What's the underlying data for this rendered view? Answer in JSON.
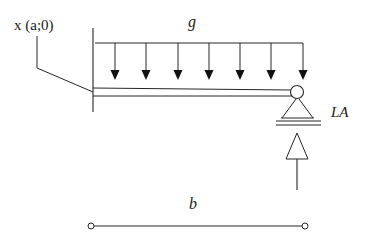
{
  "figure": {
    "title_text": "",
    "stroke_color": "#262626",
    "background": "#ffffff"
  },
  "labels": {
    "point_label": "x (a;0)",
    "load_label": "g",
    "support_label": "LA",
    "span_label": "b"
  },
  "geometry": {
    "wall_line": {
      "x": 93,
      "y_top": 28,
      "y_bottom": 112
    },
    "beam_top_line": {
      "x_start": 93,
      "x_end": 300,
      "y": 88
    },
    "beam_bottom_line": {
      "x_start": 93,
      "x_end": 300,
      "y": 96
    },
    "load_bar": {
      "x_start": 95,
      "x_end": 303,
      "y": 43
    },
    "load_arrow_tips_y": 79,
    "load_arrow_x_positions": [
      115,
      146,
      178,
      209,
      240,
      271,
      303
    ],
    "load_arrow_count": 7,
    "support_pin": {
      "cx": 297,
      "cy": 92,
      "r": 6
    },
    "support_triangle": {
      "apex_x": 297,
      "apex_y": 99,
      "base_left_x": 282,
      "base_right_x": 313,
      "base_y": 118
    },
    "ground_lines": [
      {
        "x_start": 276,
        "x_end": 320,
        "y": 120
      },
      {
        "x_start": 276,
        "x_end": 320,
        "y": 124
      }
    ],
    "reaction_arrow": {
      "x": 297,
      "tail_y": 190,
      "head_tip_y": 133,
      "head_half_width": 11,
      "head_base_y": 158
    },
    "leader_line": {
      "x1": 37,
      "y1": 36,
      "x2": 37,
      "y2": 68,
      "x3": 93,
      "y3": 92
    },
    "dimension_line": {
      "x_start": 91,
      "x_end": 305,
      "y": 226,
      "end_marker_radius": 3
    }
  }
}
